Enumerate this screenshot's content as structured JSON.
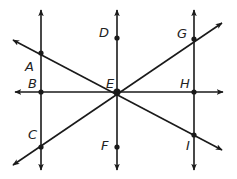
{
  "diagram": {
    "type": "geometry-lines",
    "colors": {
      "line": "#1a1a1a",
      "point": "#1a1a1a",
      "label": "#222222",
      "background": "#ffffff"
    },
    "points": [
      {
        "id": "A",
        "label": "A",
        "x": 41,
        "y": 53,
        "lx": 25,
        "ly": 60
      },
      {
        "id": "B",
        "label": "B",
        "x": 41,
        "y": 92,
        "lx": 28,
        "ly": 77
      },
      {
        "id": "C",
        "label": "C",
        "x": 41,
        "y": 147,
        "lx": 28,
        "ly": 128
      },
      {
        "id": "D",
        "label": "D",
        "x": 117,
        "y": 38,
        "lx": 99,
        "ly": 26
      },
      {
        "id": "E",
        "label": "E",
        "x": 117,
        "y": 92,
        "lx": 106,
        "ly": 77
      },
      {
        "id": "F",
        "label": "F",
        "x": 117,
        "y": 147,
        "lx": 101,
        "ly": 139
      },
      {
        "id": "G",
        "label": "G",
        "x": 194,
        "y": 39,
        "lx": 177,
        "ly": 27
      },
      {
        "id": "H",
        "label": "H",
        "x": 194,
        "y": 92,
        "lx": 180,
        "ly": 77
      },
      {
        "id": "I",
        "label": "I",
        "x": 194,
        "y": 135,
        "lx": 186,
        "ly": 139
      }
    ],
    "lines": [
      {
        "name": "line-through-A-B-C",
        "x1": 41,
        "y1": 10,
        "x2": 41,
        "y2": 170
      },
      {
        "name": "line-through-D-E-F",
        "x1": 117,
        "y1": 10,
        "x2": 117,
        "y2": 170
      },
      {
        "name": "line-through-G-H-I",
        "x1": 194,
        "y1": 10,
        "x2": 194,
        "y2": 170
      },
      {
        "name": "line-through-B-E-H",
        "x1": 15,
        "y1": 92,
        "x2": 223,
        "y2": 92
      },
      {
        "name": "line-through-A-E-I",
        "x1": 13,
        "y1": 40,
        "x2": 222,
        "y2": 150
      },
      {
        "name": "line-through-C-E-G",
        "x1": 13,
        "y1": 165,
        "x2": 222,
        "y2": 23
      }
    ]
  }
}
